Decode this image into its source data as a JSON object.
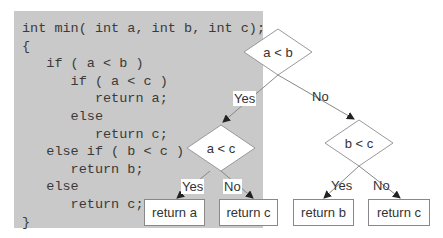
{
  "code": {
    "lines": [
      "int min( int a, int b, int c);",
      "{",
      "   if ( a < b )",
      "      if ( a < c )",
      "         return a;",
      "      else",
      "         return c;",
      "   else if ( b < c )",
      "      return b;",
      "   else",
      "      return c;",
      "}"
    ]
  },
  "flowchart": {
    "decisions": {
      "root": "a < b",
      "left": "a < c",
      "right": "b < c"
    },
    "edge_labels": {
      "root_yes": "Yes",
      "root_no": "No",
      "left_yes": "Yes",
      "left_no": "No",
      "right_yes": "Yes",
      "right_no": "No"
    },
    "terminals": {
      "return_a": "return a",
      "return_c_left": "return c",
      "return_b": "return b",
      "return_c_right": "return c"
    }
  },
  "colors": {
    "code_background": "#c9c9c9",
    "line": "#888888",
    "text": "#333333"
  }
}
